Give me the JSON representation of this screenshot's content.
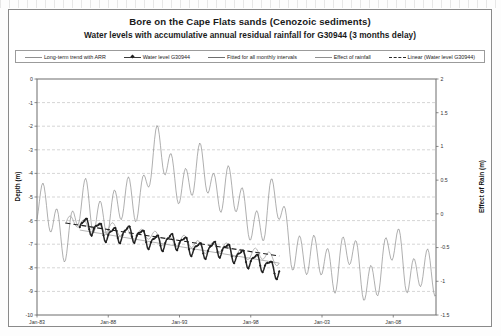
{
  "chart_data": {
    "type": "line",
    "title": "Bore on the Cape Flats sands (Cenozoic sediments)",
    "subtitle": "Water levels with accumulative annual residual rainfall for G30944 (3 months delay)",
    "xlabel": "",
    "ylabel": "Depth (m)",
    "y2label": "Effect of Rain (m)",
    "ylim": [
      -10,
      0
    ],
    "y2lim": [
      -1.5,
      2
    ],
    "xlim": [
      "Jan-83",
      "Jan-11"
    ],
    "grid": true,
    "legend_position": "top",
    "xticks": [
      "Jan-83",
      "Jan-88",
      "Jan-93",
      "Jan-98",
      "Jan-03",
      "Jan-08"
    ],
    "yticks": [
      "0",
      "-1",
      "-2",
      "-3",
      "-4",
      "-5",
      "-6",
      "-7",
      "-8",
      "-9",
      "-10"
    ],
    "y2ticks": [
      "2",
      "1.5",
      "1",
      "0.5",
      "0",
      "-0.5",
      "-1",
      "-1.5"
    ],
    "series": [
      {
        "name": "Long-term trend with ARR",
        "axis": "left",
        "style": "thin-line",
        "color": "#8d8d8d",
        "x": [
          1986.0,
          1988.0,
          1990.0,
          1992.0,
          1994.0,
          1996.0,
          1998.0,
          2000.0
        ],
        "values": [
          -6.15,
          -6.3,
          -6.5,
          -6.7,
          -6.95,
          -7.2,
          -7.45,
          -7.6
        ]
      },
      {
        "name": "Water level G30944",
        "axis": "left",
        "style": "thick-marker-line",
        "color": "#222222",
        "x": [
          1986.0,
          1986.3,
          1986.6,
          1986.9,
          1987.2,
          1987.5,
          1987.8,
          1988.1,
          1988.4,
          1988.7,
          1989.0,
          1989.3,
          1989.6,
          1989.9,
          1990.2,
          1990.5,
          1990.8,
          1991.1,
          1991.4,
          1991.7,
          1992.0,
          1992.3,
          1992.6,
          1992.9,
          1993.2,
          1993.5,
          1993.8,
          1994.1,
          1994.4,
          1994.7,
          1995.0,
          1995.3,
          1995.6,
          1995.9,
          1996.2,
          1996.5,
          1996.8,
          1997.1,
          1997.4,
          1997.7,
          1998.0,
          1998.3,
          1998.6,
          1998.9,
          1999.2,
          1999.5,
          1999.8,
          2000.0
        ],
        "values": [
          -6.5,
          -6.2,
          -6.6,
          -6.3,
          -6.9,
          -6.4,
          -6.1,
          -6.5,
          -6.2,
          -6.6,
          -6.1,
          -6.5,
          -6.2,
          -6.6,
          -6.3,
          -6.0,
          -6.4,
          -6.1,
          -6.5,
          -6.2,
          -6.0,
          -6.4,
          -6.2,
          -6.6,
          -6.3,
          -6.6,
          -6.4,
          -6.8,
          -6.5,
          -6.9,
          -6.6,
          -7.0,
          -6.7,
          -7.1,
          -6.8,
          -7.2,
          -6.9,
          -7.3,
          -7.0,
          -7.4,
          -7.2,
          -7.6,
          -7.4,
          -7.8,
          -7.6,
          -8.0,
          -7.8,
          -7.5
        ]
      },
      {
        "name": "Fitted for all monthly intervals",
        "axis": "left",
        "style": "thin-line",
        "color": "#9a9a9a",
        "x": [
          1986.0,
          1988.0,
          1990.0,
          1992.0,
          1994.0,
          1996.0,
          1998.0,
          2000.0
        ],
        "values": [
          -6.4,
          -6.6,
          -6.8,
          -7.0,
          -7.2,
          -7.4,
          -7.6,
          -7.8
        ]
      },
      {
        "name": "Effect of rainfall",
        "axis": "right",
        "style": "thin-line",
        "color": "#8d8d8d",
        "note": "Oscillating accumulative annual residual rainfall series spanning Jan-83 to Jan-11"
      },
      {
        "name": "Linear (Water level G30944)",
        "axis": "left",
        "style": "dashed",
        "color": "#222222",
        "x": [
          1985.0,
          2000.0
        ],
        "values": [
          -6.1,
          -7.5
        ]
      }
    ],
    "annotations": []
  },
  "legend": {
    "items": [
      {
        "label": "Long-term trend with ARR",
        "swatch": "thin-line"
      },
      {
        "label": "Water level G30944",
        "swatch": "marker-line"
      },
      {
        "label": "Fitted for all monthly intervals",
        "swatch": "thin-line"
      },
      {
        "label": "Effect of rainfall",
        "swatch": "thin-line"
      },
      {
        "label": "Linear (Water level G30944)",
        "swatch": "dashed"
      }
    ]
  }
}
